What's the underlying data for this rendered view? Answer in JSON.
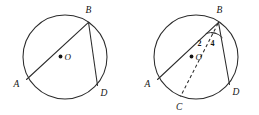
{
  "figure": {
    "background_color": "#ffffff",
    "stroke_color": "#2b2b2b",
    "label_color": "#141414",
    "width": 259,
    "height": 115
  },
  "left_circle": {
    "name": "circle-O-inscribed-angle",
    "center_label": "O",
    "center_dot": true,
    "points": [
      {
        "label": "A",
        "position": "lower-left"
      },
      {
        "label": "B",
        "position": "top-right"
      },
      {
        "label": "D",
        "position": "lower-right"
      }
    ],
    "segments": [
      {
        "from": "B",
        "to": "A",
        "style": "solid"
      },
      {
        "from": "B",
        "to": "D",
        "style": "solid"
      }
    ]
  },
  "right_circle": {
    "name": "circle-O-with-diameter-and-angles",
    "center_label": "O",
    "center_dot": true,
    "points": [
      {
        "label": "A",
        "position": "lower-left"
      },
      {
        "label": "B",
        "position": "top-right"
      },
      {
        "label": "C",
        "position": "bottom"
      },
      {
        "label": "D",
        "position": "lower-right"
      }
    ],
    "segments": [
      {
        "from": "B",
        "to": "A",
        "style": "solid"
      },
      {
        "from": "B",
        "to": "D",
        "style": "solid"
      },
      {
        "from": "B",
        "to": "C",
        "style": "dashed"
      }
    ],
    "angle_labels": [
      {
        "id": "angle-2",
        "text": "2",
        "vertex": "B",
        "between": "BA and BC"
      },
      {
        "id": "angle-4",
        "text": "4",
        "vertex": "B",
        "between": "BC and BD"
      }
    ],
    "angle_arc_at_vertex": "B"
  }
}
